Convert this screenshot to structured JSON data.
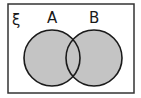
{
  "diagram": {
    "type": "venn",
    "universal_symbol": "ξ",
    "sets": [
      {
        "label": "A",
        "shaded": true
      },
      {
        "label": "B",
        "shaded": true
      }
    ],
    "shaded_region": "A ∪ B",
    "colors": {
      "fill": "#c4c4c4",
      "stroke": "#1a1a1a",
      "background": "#ffffff"
    }
  }
}
